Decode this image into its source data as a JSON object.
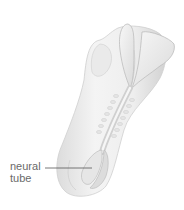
{
  "figure": {
    "colors": {
      "background": "#ffffff",
      "tissue_fill": "#f1f1f1",
      "tissue_shadow": "#d6d6d6",
      "tissue_outline": "#c4c4c4",
      "leader_line": "#555555",
      "label_text": "#6a6a6a"
    }
  },
  "labels": [
    {
      "line1": "neural",
      "line2": "tube"
    }
  ]
}
